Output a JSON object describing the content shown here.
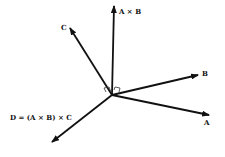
{
  "diagram": {
    "title": "",
    "origin": [
      112,
      95
    ],
    "color": "#111111",
    "vectors": [
      {
        "id": "AxB",
        "label": "A × B",
        "tip": [
          114,
          5
        ],
        "label_pos": [
          119,
          11
        ]
      },
      {
        "id": "C",
        "label": "C",
        "tip": [
          69,
          27
        ],
        "label_pos": [
          61,
          25
        ]
      },
      {
        "id": "B",
        "label": "B",
        "tip": [
          199,
          75
        ],
        "label_pos": [
          203,
          72
        ]
      },
      {
        "id": "A",
        "label": "A",
        "tip": [
          210,
          115
        ],
        "label_pos": [
          205,
          118
        ]
      },
      {
        "id": "D",
        "label": "D = (A × B) × C",
        "tip": [
          51,
          143
        ],
        "label_pos": [
          10,
          114
        ]
      }
    ],
    "right_angle_markers": 2
  }
}
